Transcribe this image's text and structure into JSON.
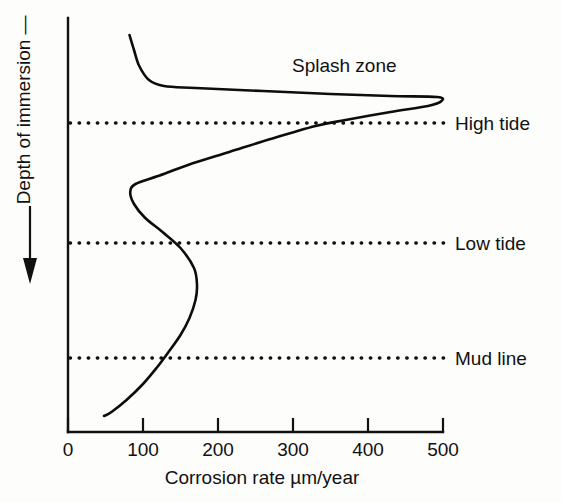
{
  "chart_data": {
    "type": "line",
    "title": "",
    "xlabel": "Corrosion rate µm/year",
    "ylabel": "Depth of immersion",
    "ylabel_prefix": "—",
    "xlim": [
      0,
      500
    ],
    "xticks": [
      0,
      100,
      200,
      300,
      400,
      500
    ],
    "xtick_labels": [
      "0",
      "100",
      "200",
      "300",
      "400",
      "500"
    ],
    "grid": false,
    "y_axis_direction": "downward",
    "y_axis_arrow": true,
    "legend": "none",
    "annotations": [
      {
        "text": "Splash zone",
        "x": 300,
        "depth_px": 65
      }
    ],
    "zone_lines": [
      {
        "label": "High tide",
        "depth_px": 123
      },
      {
        "label": "Low tide",
        "depth_px": 243
      },
      {
        "label": "Mud line",
        "depth_px": 358
      }
    ],
    "series": [
      {
        "name": "Corrosion rate vs depth",
        "comment": "x = corrosion rate in um/year, y = depth in screen pixels (increasing downward)",
        "points": [
          {
            "x": 82,
            "y": 35
          },
          {
            "x": 88,
            "y": 50
          },
          {
            "x": 95,
            "y": 66
          },
          {
            "x": 108,
            "y": 80
          },
          {
            "x": 128,
            "y": 86
          },
          {
            "x": 170,
            "y": 88
          },
          {
            "x": 260,
            "y": 91
          },
          {
            "x": 350,
            "y": 94
          },
          {
            "x": 430,
            "y": 96
          },
          {
            "x": 492,
            "y": 97
          },
          {
            "x": 498,
            "y": 101
          },
          {
            "x": 480,
            "y": 106
          },
          {
            "x": 430,
            "y": 112
          },
          {
            "x": 370,
            "y": 120
          },
          {
            "x": 330,
            "y": 126
          },
          {
            "x": 270,
            "y": 139
          },
          {
            "x": 215,
            "y": 152
          },
          {
            "x": 160,
            "y": 165
          },
          {
            "x": 120,
            "y": 176
          },
          {
            "x": 90,
            "y": 184
          },
          {
            "x": 83,
            "y": 192
          },
          {
            "x": 88,
            "y": 204
          },
          {
            "x": 103,
            "y": 218
          },
          {
            "x": 126,
            "y": 232
          },
          {
            "x": 150,
            "y": 248
          },
          {
            "x": 168,
            "y": 268
          },
          {
            "x": 172,
            "y": 285
          },
          {
            "x": 170,
            "y": 300
          },
          {
            "x": 162,
            "y": 318
          },
          {
            "x": 150,
            "y": 335
          },
          {
            "x": 134,
            "y": 352
          },
          {
            "x": 118,
            "y": 368
          },
          {
            "x": 100,
            "y": 384
          },
          {
            "x": 78,
            "y": 400
          },
          {
            "x": 58,
            "y": 412
          },
          {
            "x": 48,
            "y": 416
          }
        ]
      }
    ]
  },
  "axes": {
    "plot_left_px": 68,
    "plot_right_px": 443,
    "plot_top_px": 18,
    "plot_bottom_px": 432
  }
}
